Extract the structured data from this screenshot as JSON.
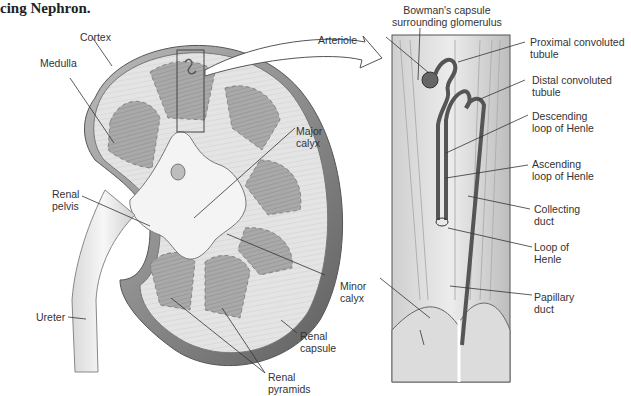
{
  "caption": "cing Nephron.",
  "kidney_labels": {
    "cortex": "Cortex",
    "medulla": "Medulla",
    "major_calyx": "Major\ncalyx",
    "renal_pelvis": "Renal\npelvis",
    "minor_calyx": "Minor\ncalyx",
    "ureter": "Ureter",
    "renal_capsule": "Renal\ncapsule",
    "renal_pyramids": "Renal\npyramids"
  },
  "nephron_labels": {
    "bowmans_capsule": "Bowman's capsule\nsurrounding glomerulus",
    "arteriole": "Arteriole",
    "proximal_tubule": "Proximal convoluted\ntubule",
    "distal_tubule": "Distal convoluted\ntubule",
    "descending_loop": "Descending\nloop of Henle",
    "ascending_loop": "Ascending\nloop of Henle",
    "collecting_duct": "Collecting\nduct",
    "loop_of_henle": "Loop of\nHenle",
    "papillary_duct": "Papillary\nduct"
  },
  "colors": {
    "capsule_dark": "#6e6e6e",
    "cortex": "#e6e6e6",
    "pyramid": "#a8a8a8",
    "pelvis": "#f2f2f2",
    "line": "#333333",
    "tubule": "#555555"
  }
}
